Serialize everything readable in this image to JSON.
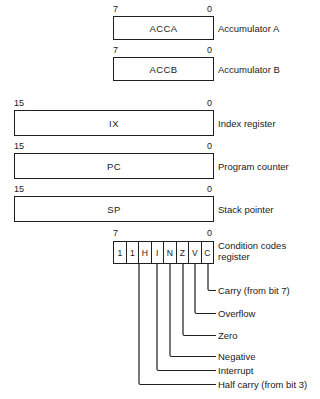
{
  "diagram": {
    "background_color": "#ffffff",
    "line_color": "#1f1f1f",
    "registers_8bit": [
      {
        "name": "ACCA",
        "label": "Accumulator A",
        "msb": "7",
        "lsb": "0"
      },
      {
        "name": "ACCB",
        "label": "Accumulator B",
        "msb": "7",
        "lsb": "0"
      }
    ],
    "registers_16bit": [
      {
        "name": "IX",
        "label": "Index register",
        "msb": "15",
        "lsb": "0"
      },
      {
        "name": "PC",
        "label": "Program counter",
        "msb": "15",
        "lsb": "0"
      },
      {
        "name": "SP",
        "label": "Stack pointer",
        "msb": "15",
        "lsb": "0"
      }
    ],
    "condition_codes": {
      "msb": "7",
      "lsb": "0",
      "label_line1": "Condition codes",
      "label_line2": "register",
      "bits": [
        {
          "value": "1",
          "bit": 7
        },
        {
          "value": "1",
          "bit": 6
        },
        {
          "value": "H",
          "bit": 5
        },
        {
          "value": "I",
          "bit": 4
        },
        {
          "value": "N",
          "bit": 3
        },
        {
          "value": "Z",
          "bit": 2
        },
        {
          "value": "V",
          "bit": 1
        },
        {
          "value": "C",
          "bit": 0
        }
      ],
      "callouts": [
        {
          "flag": "C",
          "text": "Carry (from bit 7)"
        },
        {
          "flag": "V",
          "text": "Overflow"
        },
        {
          "flag": "Z",
          "text": "Zero"
        },
        {
          "flag": "N",
          "text": "Negative"
        },
        {
          "flag": "I",
          "text": "Interrupt"
        },
        {
          "flag": "H",
          "text": "Half carry (from bit 3)"
        }
      ]
    }
  }
}
